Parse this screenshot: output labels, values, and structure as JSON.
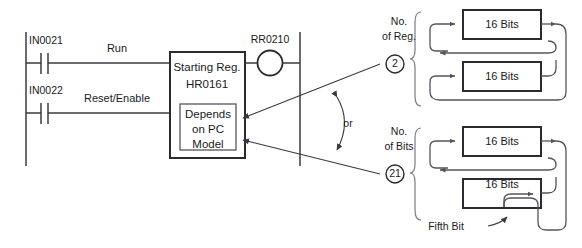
{
  "diagram": {
    "colors": {
      "line": "#3a3a42",
      "box_border": "#2a2a32",
      "route": "#54545c",
      "brace": "#7a7a84",
      "background": "#ffffff",
      "text": "#1a1a22"
    }
  },
  "ladder": {
    "contacts": [
      {
        "tag": "IN0021",
        "rung_label": "Run"
      },
      {
        "tag": "IN0022",
        "rung_label": "Reset/Enable"
      }
    ],
    "output_coil": {
      "tag": "RR0210"
    },
    "function_block": {
      "line1": "Starting Reg.",
      "line2": "HR0161",
      "inner_note": {
        "line1": "Depends",
        "line2": "on PC",
        "line3": "Model"
      }
    }
  },
  "selector": {
    "or_label": "or",
    "options": [
      {
        "label_line1": "No.",
        "label_line2": "of Reg.",
        "value": "2"
      },
      {
        "label_line1": "No.",
        "label_line2": "of Bits",
        "value": "21"
      }
    ]
  },
  "register_groups": [
    {
      "name": "no-of-reg-group",
      "registers": [
        {
          "label": "16 Bits"
        },
        {
          "label": "16 Bits"
        }
      ]
    },
    {
      "name": "no-of-bits-group",
      "registers": [
        {
          "label": "16 Bits"
        },
        {
          "label": "16 Bits"
        }
      ],
      "annotation": "Fifth Bit"
    }
  ]
}
